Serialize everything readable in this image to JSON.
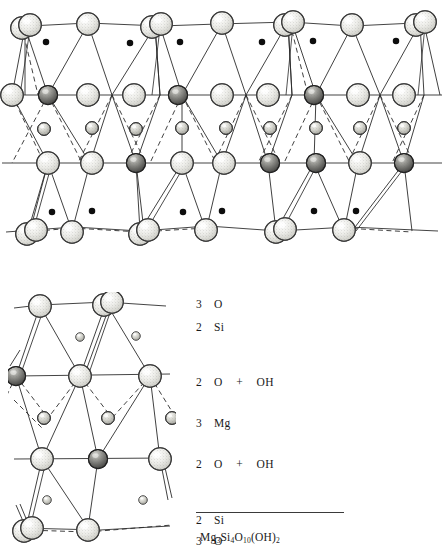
{
  "figure": {
    "kind": "crystal-structure-diagram",
    "mineral": "talc",
    "formula_plain": "Mg3Si4O10(OH)2",
    "formula_parts": [
      {
        "text": "Mg",
        "sub": "3"
      },
      {
        "text": "Si",
        "sub": "4"
      },
      {
        "text": "O",
        "sub": "10"
      },
      {
        "text": "(OH)",
        "sub": "2"
      }
    ]
  },
  "legend": {
    "rows": [
      {
        "count": "3",
        "species": "O",
        "plus": "",
        "species2": "",
        "top": 0
      },
      {
        "count": "2",
        "species": "Si",
        "plus": "",
        "species2": "",
        "top": 23
      },
      {
        "count": "2",
        "species": "O",
        "plus": "+",
        "species2": "OH",
        "top": 78
      },
      {
        "count": "3",
        "species": "Mg",
        "plus": "",
        "species2": "",
        "top": 119
      },
      {
        "count": "2",
        "species": "O",
        "plus": "+",
        "species2": "OH",
        "top": 160
      },
      {
        "count": "2",
        "species": "Si",
        "plus": "",
        "species2": "",
        "top": 216
      },
      {
        "count": "3",
        "species": "O",
        "plus": "",
        "species2": "",
        "top": 237
      }
    ],
    "rule_top": 512,
    "formula_top": 531
  },
  "colors": {
    "ink": "#1a1a1a",
    "line": "#2b2b2b",
    "oxygen_fill": "#e8e8e4",
    "oxygen_stroke": "#3a3a3a",
    "hydroxyl_fill": "#6d6d6d",
    "hydroxyl_stroke": "#222222",
    "magnesium_fill": "#cfcfc9",
    "magnesium_stroke": "#333333",
    "silicon_fill": "#0d0d0d",
    "background": "#ffffff"
  },
  "atoms": {
    "legend_species": [
      "O",
      "OH",
      "Mg",
      "Si"
    ],
    "radii": {
      "oxygen": 11.5,
      "hydroxyl": 9.5,
      "magnesium": 6.5,
      "silicon": 3.2
    }
  },
  "chart_data": {
    "type": "scatter",
    "xlabel": "",
    "ylabel": "",
    "layers": [
      {
        "name": "3 O",
        "y": 25,
        "species": "O",
        "count_per_formula": 3
      },
      {
        "name": "2 Si",
        "y": 42,
        "species": "Si",
        "count_per_formula": 2
      },
      {
        "name": "2 O + OH",
        "y": 95,
        "species": "O+OH",
        "count_per_formula": 3
      },
      {
        "name": "3 Mg",
        "y": 128,
        "species": "Mg",
        "count_per_formula": 3
      },
      {
        "name": "2 O + OH",
        "y": 163,
        "species": "O+OH",
        "count_per_formula": 3
      },
      {
        "name": "2 Si",
        "y": 212,
        "species": "Si",
        "count_per_formula": 2
      },
      {
        "name": "3 O",
        "y": 230,
        "species": "O",
        "count_per_formula": 3
      }
    ]
  }
}
